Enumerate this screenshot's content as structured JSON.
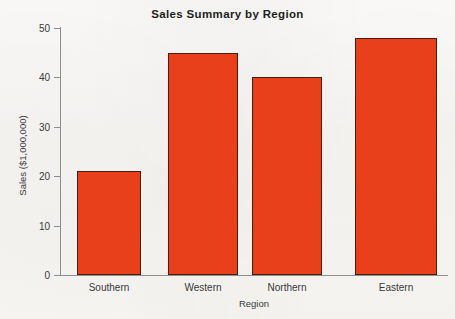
{
  "chart_data": {
    "type": "bar",
    "title": "Sales Summary by Region",
    "xlabel": "Region",
    "ylabel": "Sales ($1,000,000)",
    "categories": [
      "Southern",
      "Western",
      "Northern",
      "Eastern"
    ],
    "values": [
      21,
      45,
      40,
      48
    ],
    "ylim": [
      0,
      50
    ],
    "ytick_labels": [
      "50",
      "40",
      "30",
      "20",
      "10",
      "0"
    ],
    "ytick_values": [
      50,
      40,
      30,
      20,
      10,
      0
    ],
    "grid": false,
    "legend": false,
    "legend_position": "none",
    "bar_color": "#e8401a",
    "bar_edge_color": "#4a1c0c",
    "axis_color": "#8e8e8e",
    "text_color": "#3a3a3a",
    "background_color": "#fbfaf8"
  }
}
